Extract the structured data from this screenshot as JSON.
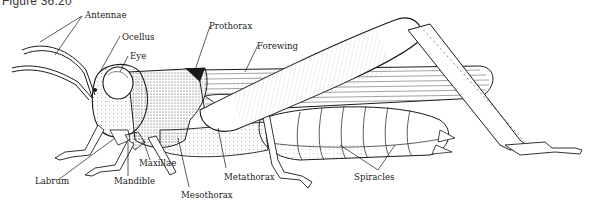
{
  "figure": {
    "title": "Figure 36.20"
  },
  "labels": [
    {
      "id": "antennae",
      "text": "Antennae"
    },
    {
      "id": "ocellus",
      "text": "Ocellus"
    },
    {
      "id": "eye",
      "text": "Eye"
    },
    {
      "id": "prothorax",
      "text": "Prothorax"
    },
    {
      "id": "forewing",
      "text": "Forewing"
    },
    {
      "id": "labrum",
      "text": "Labrum"
    },
    {
      "id": "mandible",
      "text": "Mandible"
    },
    {
      "id": "maxillae",
      "text": "Maxillae"
    },
    {
      "id": "mesothorax",
      "text": "Mesothorax"
    },
    {
      "id": "metathorax",
      "text": "Metathorax"
    },
    {
      "id": "spiracles",
      "text": "Spiracles"
    }
  ],
  "colors": {
    "ink": "#1a1a1a",
    "shade": "#6b6b6b",
    "paper": "#ffffff"
  }
}
